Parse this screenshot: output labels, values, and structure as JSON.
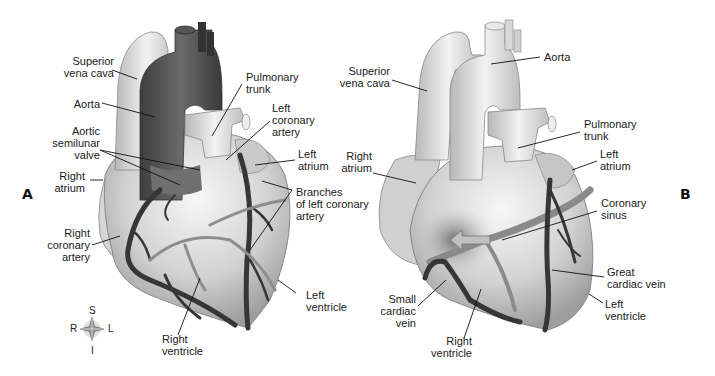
{
  "figure": {
    "panels": [
      {
        "id": "A",
        "label": "A",
        "view": "anterior",
        "labels": {
          "superior_vena_cava": "Superior\nvena cava",
          "aorta": "Aorta",
          "aortic_semilunar_valve": "Aortic\nsemilunar\nvalve",
          "right_atrium": "Right\natrium",
          "right_coronary_artery": "Right\ncoronary\nartery",
          "pulmonary_trunk": "Pulmonary\ntrunk",
          "left_coronary_artery": "Left\ncoronary\nartery",
          "left_atrium": "Left\natrium",
          "branches_left_coronary": "Branches\nof left coronary\nartery",
          "left_ventricle": "Left\nventricle",
          "right_ventricle": "Right\nventricle"
        }
      },
      {
        "id": "B",
        "label": "B",
        "view": "posterior",
        "labels": {
          "superior_vena_cava": "Superior\nvena cava",
          "aorta": "Aorta",
          "pulmonary_trunk": "Pulmonary\ntrunk",
          "right_atrium": "Right\natrium",
          "left_atrium": "Left\natrium",
          "coronary_sinus": "Coronary\nsinus",
          "great_cardiac_vein": "Great\ncardiac vein",
          "left_ventricle": "Left\nventricle",
          "small_cardiac_vein": "Small\ncardiac\nvein",
          "right_ventricle": "Right\nventricle"
        }
      }
    ],
    "compass": {
      "top": "S",
      "bottom": "I",
      "left": "R",
      "right": "L"
    },
    "colors": {
      "background": "#ffffff",
      "heart_light": "#e6e6e6",
      "heart_mid": "#bdbdbd",
      "vessel_dark": "#3a3a3a",
      "aorta_dark": "#555555",
      "vein_mid": "#8a8a8a",
      "text": "#1a1a1a"
    }
  }
}
